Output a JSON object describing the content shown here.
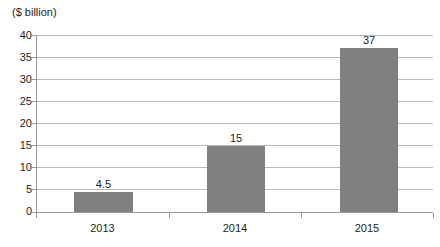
{
  "chart_data": {
    "type": "bar",
    "title": "",
    "subtitle": "",
    "unit_label": "($ billion)",
    "xlabel": "",
    "ylabel": "",
    "categories": [
      "2013",
      "2014",
      "2015"
    ],
    "values": [
      4.5,
      15,
      37
    ],
    "data_labels": [
      "4.5",
      "15",
      "37"
    ],
    "ylim": [
      0,
      40
    ],
    "ytick_step": 5,
    "yticks": [
      0,
      5,
      10,
      15,
      20,
      25,
      30,
      35,
      40
    ],
    "ytick_labels": [
      "0",
      "5",
      "10",
      "15",
      "20",
      "25",
      "30",
      "35",
      "40"
    ],
    "grid": true,
    "grid_axis": "y",
    "legend": false,
    "legend_position": "none",
    "series": [
      {
        "name": "",
        "values": [
          4.5,
          15,
          37
        ],
        "color": "#808080"
      }
    ],
    "colors": {
      "bar": "#808080",
      "gridline": "#b9b9b9",
      "axis": "#9a9a9a",
      "text": "#1d1d1d",
      "background": "#ffffff"
    }
  }
}
